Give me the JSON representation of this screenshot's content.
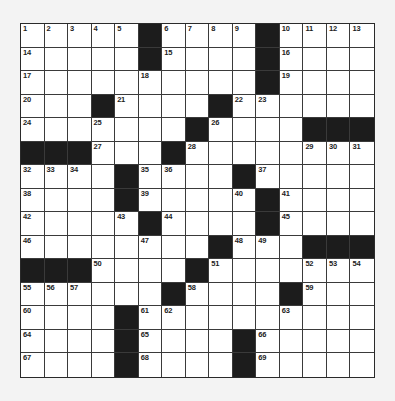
{
  "puzzle": {
    "rows": 15,
    "cols": 15,
    "colors": {
      "background": "#f3f3f3",
      "cell_white": "#ffffff",
      "cell_black": "#1c1c1c",
      "grid_line": "#3a3a3a"
    },
    "grid": [
      [
        "1",
        "2",
        "3",
        "4",
        "5",
        "#",
        "6",
        "7",
        "8",
        "9",
        "#",
        "10",
        "11",
        "12",
        "13"
      ],
      [
        "14",
        ".",
        ".",
        ".",
        ".",
        "#",
        "15",
        ".",
        ".",
        ".",
        "#",
        "16",
        ".",
        ".",
        "."
      ],
      [
        "17",
        ".",
        ".",
        ".",
        ".",
        "18",
        ".",
        ".",
        ".",
        ".",
        "#",
        "19",
        ".",
        ".",
        "."
      ],
      [
        "20",
        ".",
        ".",
        "#",
        "21",
        ".",
        ".",
        ".",
        "#",
        "22",
        "23",
        ".",
        ".",
        ".",
        "."
      ],
      [
        "24",
        ".",
        ".",
        "25",
        ".",
        ".",
        ".",
        "#",
        "26",
        ".",
        ".",
        ".",
        "#",
        "#",
        "#"
      ],
      [
        "#",
        "#",
        "#",
        "27",
        ".",
        ".",
        "#",
        "28",
        ".",
        ".",
        ".",
        ".",
        "29",
        "30",
        "31"
      ],
      [
        "32",
        "33",
        "34",
        ".",
        "#",
        "35",
        "36",
        ".",
        ".",
        "#",
        "37",
        ".",
        ".",
        ".",
        "."
      ],
      [
        "38",
        ".",
        ".",
        ".",
        "#",
        "39",
        ".",
        ".",
        ".",
        "40",
        "#",
        "41",
        ".",
        ".",
        "."
      ],
      [
        "42",
        ".",
        ".",
        ".",
        "43",
        "#",
        "44",
        ".",
        ".",
        ".",
        "#",
        "45",
        ".",
        ".",
        "."
      ],
      [
        "46",
        ".",
        ".",
        ".",
        ".",
        "47",
        ".",
        ".",
        "#",
        "48",
        "49",
        ".",
        "#",
        "#",
        "#"
      ],
      [
        "#",
        "#",
        "#",
        "50",
        ".",
        ".",
        ".",
        "#",
        "51",
        ".",
        ".",
        ".",
        "52",
        "53",
        "54"
      ],
      [
        "55",
        "56",
        "57",
        ".",
        ".",
        ".",
        "#",
        "58",
        ".",
        ".",
        ".",
        "#",
        "59",
        ".",
        "."
      ],
      [
        "60",
        ".",
        ".",
        ".",
        "#",
        "61",
        "62",
        ".",
        ".",
        ".",
        ".",
        "63",
        ".",
        ".",
        "."
      ],
      [
        "64",
        ".",
        ".",
        ".",
        "#",
        "65",
        ".",
        ".",
        ".",
        "#",
        "66",
        ".",
        ".",
        ".",
        "."
      ],
      [
        "67",
        ".",
        ".",
        ".",
        "#",
        "68",
        ".",
        ".",
        ".",
        "#",
        "69",
        ".",
        ".",
        ".",
        "."
      ]
    ],
    "clue_numbers": [
      1,
      2,
      3,
      4,
      5,
      6,
      7,
      8,
      9,
      10,
      11,
      12,
      13,
      14,
      15,
      16,
      17,
      18,
      19,
      20,
      21,
      22,
      23,
      24,
      25,
      26,
      27,
      28,
      29,
      30,
      31,
      32,
      33,
      34,
      35,
      36,
      37,
      38,
      39,
      40,
      41,
      42,
      43,
      44,
      45,
      46,
      47,
      48,
      49,
      50,
      51,
      52,
      53,
      54,
      55,
      56,
      57,
      58,
      59,
      60,
      61,
      62,
      63,
      64,
      65,
      66,
      67,
      68,
      69
    ]
  }
}
